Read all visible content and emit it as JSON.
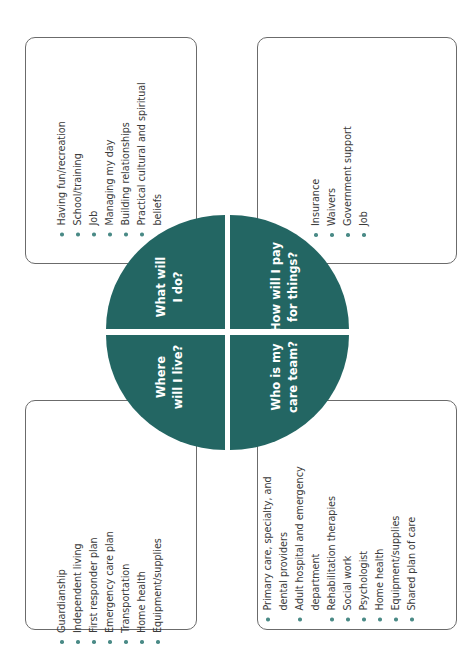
{
  "colors": {
    "quadrant_fill": "#236663",
    "bullet": "#4a8a86",
    "box_border": "#6b6b6b",
    "text": "#3a3a3a"
  },
  "quadrants": {
    "what_will_i_do": {
      "line1": "What will",
      "line2": "I do?"
    },
    "how_will_i_pay": {
      "line1": "How will I pay",
      "line2": "for things?"
    },
    "where_will_i_live": {
      "line1": "Where",
      "line2": "will I live?"
    },
    "who_is_my_care_team": {
      "line1": "Who is my",
      "line2": "care team?"
    }
  },
  "boxes": {
    "what_will_i_do": {
      "items": [
        "Having fun/recreation",
        "School/training",
        "Job",
        "Managing my day",
        "Building relationships",
        "Practical cultural and spiritual",
        "beliefs"
      ]
    },
    "how_will_i_pay": {
      "items": [
        "Insurance",
        "Waivers",
        "Government support",
        "Job"
      ]
    },
    "where_will_i_live": {
      "items": [
        "Guardianship",
        "Independent living",
        "First responder plan",
        "Emergency care plan",
        "Transportation",
        "Home health",
        "Equipment/supplies"
      ]
    },
    "who_is_my_care_team": {
      "items": [
        "Primary care, specialty, and",
        "dental providers",
        "Adult hospital and emergency",
        "department",
        "Rehabilitation therapies",
        "Social work",
        "Psychologist",
        "Home health",
        "Equipment/supplies",
        "Shared plan of care"
      ]
    }
  }
}
